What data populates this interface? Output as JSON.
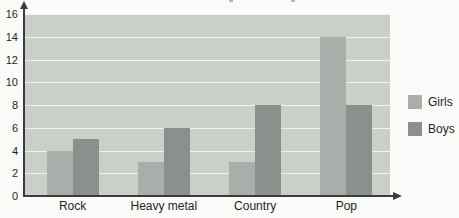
{
  "chart_data": {
    "type": "bar",
    "categories": [
      "Rock",
      "Heavy metal",
      "Country",
      "Pop"
    ],
    "series": [
      {
        "name": "Girls",
        "color": "#a9aeaa",
        "values": [
          4,
          3,
          3,
          14
        ]
      },
      {
        "name": "Boys",
        "color": "#8b908c",
        "values": [
          5,
          6,
          8,
          8
        ]
      }
    ],
    "ylim": [
      0,
      16
    ],
    "yticks": [
      0,
      2,
      4,
      6,
      8,
      10,
      12,
      14,
      16
    ],
    "grid": true,
    "legend_position": "right",
    "legend_labels": [
      "Girls",
      "Boys"
    ],
    "colors": {
      "page_bg": "#fbfbf9",
      "plot_bg": "#cacfca",
      "gridline": "#f0f2f0",
      "axis": "#3c3c3c",
      "text": "#1e1e1e"
    }
  }
}
